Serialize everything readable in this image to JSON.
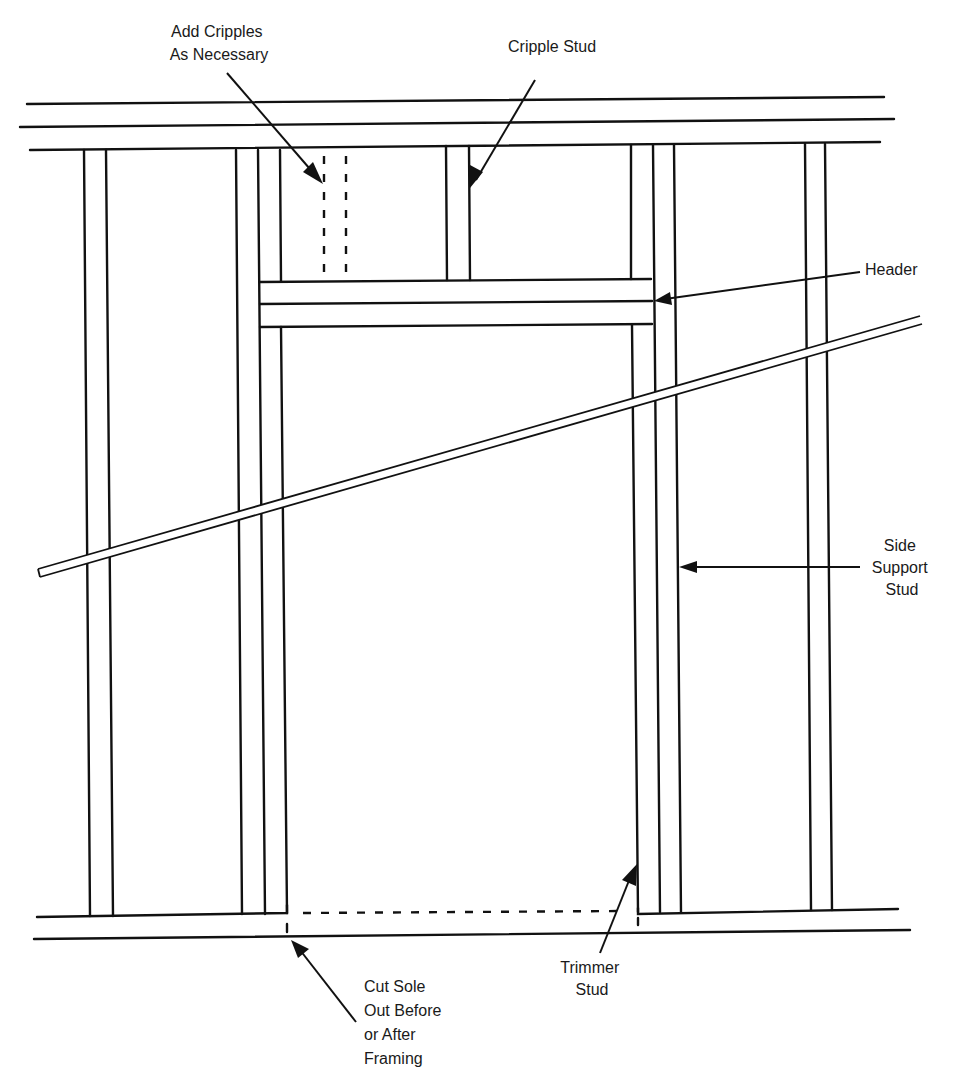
{
  "diagram": {
    "colors": {
      "ink": "#111111",
      "background": "#ffffff"
    },
    "labels": {
      "add_cripples": [
        "Add Cripples",
        "As Necessary"
      ],
      "cripple_stud": "Cripple Stud",
      "header": "Header",
      "side_support_stud": [
        "Side",
        "Support",
        "Stud"
      ],
      "trimmer_stud": [
        "Trimmer",
        "Stud"
      ],
      "cut_sole": [
        "Cut Sole",
        "Out Before",
        "or After",
        "Framing"
      ]
    },
    "components": [
      "Double top plate",
      "Sole plate",
      "Common studs",
      "Side support studs",
      "Trimmer studs",
      "Header (doubled)",
      "Cripple studs",
      "Diagonal let-in brace",
      "Door opening in sole plate"
    ]
  }
}
